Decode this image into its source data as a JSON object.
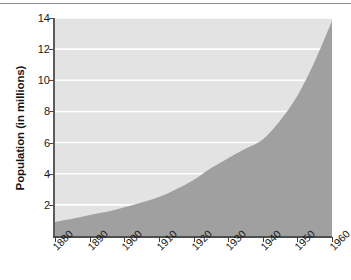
{
  "chart_data": {
    "type": "area",
    "title": "",
    "xlabel": "",
    "ylabel": "Population (in millions)",
    "xlim": [
      1880,
      1960
    ],
    "ylim": [
      0,
      14
    ],
    "grid": true,
    "grid_color": "#ffffff",
    "legend": "none",
    "area_fill_color": "#a0a0a0",
    "background_color": "#e3e3e3",
    "axis_color": "#4f4f4f",
    "x_tick_labels": [
      "1880",
      "1890",
      "1900",
      "1910",
      "1920",
      "1930",
      "1940",
      "1950",
      "1960"
    ],
    "x_ticks": [
      1880,
      1890,
      1900,
      1910,
      1920,
      1930,
      1940,
      1950,
      1960
    ],
    "y_tick_labels": [
      "2",
      "4",
      "6",
      "8",
      "10",
      "12",
      "14"
    ],
    "y_ticks": [
      2,
      4,
      6,
      8,
      10,
      12,
      14
    ],
    "x": [
      1880,
      1885,
      1890,
      1895,
      1900,
      1905,
      1910,
      1915,
      1920,
      1925,
      1930,
      1935,
      1940,
      1945,
      1950,
      1955,
      1960
    ],
    "values": [
      0.9,
      1.1,
      1.35,
      1.55,
      1.85,
      2.15,
      2.5,
      3.0,
      3.6,
      4.35,
      5.0,
      5.6,
      6.2,
      7.4,
      9.0,
      11.2,
      13.8
    ],
    "series": [
      {
        "name": "Population",
        "values": [
          0.9,
          1.1,
          1.35,
          1.55,
          1.85,
          2.15,
          2.5,
          3.0,
          3.6,
          4.35,
          5.0,
          5.6,
          6.2,
          7.4,
          9.0,
          11.2,
          13.8
        ]
      }
    ]
  }
}
